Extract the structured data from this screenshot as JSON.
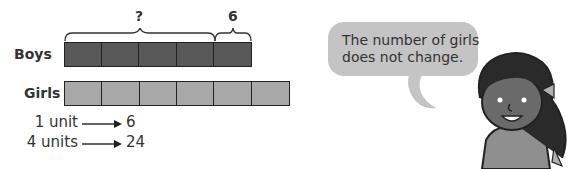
{
  "model": {
    "rows": [
      {
        "label": "Boys",
        "units": 5,
        "color": "#595959"
      },
      {
        "label": "Girls",
        "units": 6,
        "color": "#a8a8a8"
      }
    ],
    "braces": [
      {
        "label": "?",
        "spans_units": 4
      },
      {
        "label": "6",
        "spans_units": 1
      }
    ]
  },
  "equations": [
    {
      "left": "1 unit",
      "right": "6"
    },
    {
      "left": "4 units",
      "right": "24"
    }
  ],
  "speech_bubble": {
    "lines": [
      "The number of girls",
      "does not change."
    ],
    "color": "#c4c4c4"
  }
}
